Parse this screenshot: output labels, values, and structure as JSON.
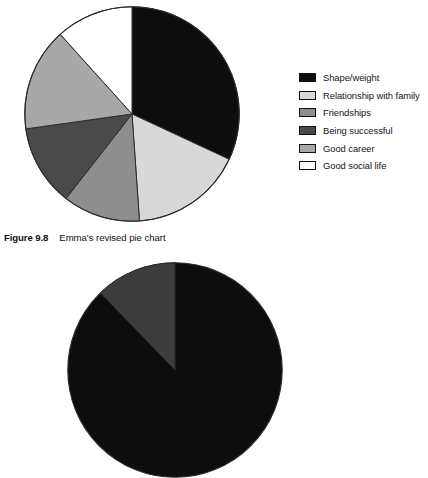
{
  "figure": {
    "caption_number": "Figure 9.8",
    "caption_text": "Emma's revised pie chart"
  },
  "chart_data": {
    "type": "pie",
    "title": "Emma's revised pie chart",
    "xlabel": "",
    "ylabel": "",
    "grid": false,
    "legend_position": "right",
    "start_angle_deg": 0,
    "direction": "clockwise",
    "center": [
      132,
      114
    ],
    "radius": 108,
    "categories": [
      "Shape/weight",
      "Relationship with family",
      "Friendships",
      "Being successful",
      "Good career",
      "Good social life"
    ],
    "values": [
      32,
      17,
      12,
      12,
      15,
      12
    ],
    "angles_deg": [
      115,
      61,
      42,
      44,
      56,
      42
    ],
    "colors": [
      "#0d0d0d",
      "#d8d8d8",
      "#8e8e8e",
      "#4a4a4a",
      "#a8a8a8",
      "#ffffff"
    ],
    "slice_outline_color": "#2b2b2b"
  },
  "legend": {
    "items": [
      {
        "label": "Shape/weight",
        "color": "#0d0d0d"
      },
      {
        "label": "Relationship with family",
        "color": "#d8d8d8"
      },
      {
        "label": "Friendships",
        "color": "#8e8e8e"
      },
      {
        "label": "Being successful",
        "color": "#4a4a4a"
      },
      {
        "label": "Good career",
        "color": "#a8a8a8"
      },
      {
        "label": "Good social life",
        "color": "#ffffff"
      }
    ]
  },
  "secondary_chart": {
    "type": "pie",
    "note_visible": "partially cropped at bottom edge",
    "colors": [
      "#0d0d0d",
      "#3d3d3d",
      "#111111"
    ]
  }
}
